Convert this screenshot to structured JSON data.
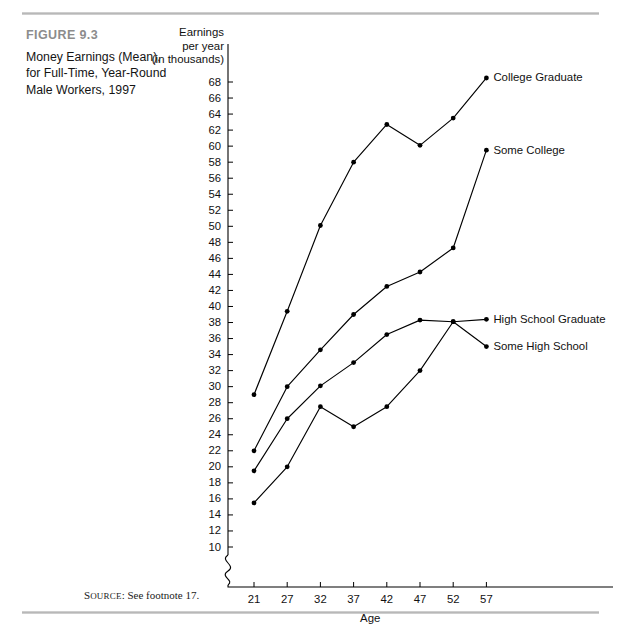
{
  "figure": {
    "label": "FIGURE 9.3",
    "title": "Money Earnings (Mean), for Full-Time, Year-Round Male Workers, 1997",
    "source_prefix": "S",
    "source_smallcaps": "OURCE",
    "source_text": ": See footnote 17."
  },
  "chart_data": {
    "type": "line",
    "title": "Money Earnings (Mean), for Full-Time, Year-Round Male Workers, 1997",
    "xlabel": "Age",
    "ylabel": "Earnings per year (in thousands)",
    "ylabel_lines": [
      "Earnings",
      "per year",
      "(in thousands)"
    ],
    "x": [
      21,
      27,
      32,
      37,
      42,
      47,
      52,
      57
    ],
    "xticklabels": [
      "21",
      "27",
      "32",
      "37",
      "42",
      "47",
      "52",
      "57"
    ],
    "yticks": [
      10,
      12,
      14,
      16,
      18,
      20,
      22,
      24,
      26,
      28,
      30,
      32,
      34,
      36,
      38,
      40,
      42,
      44,
      46,
      48,
      50,
      52,
      54,
      56,
      58,
      60,
      62,
      64,
      66,
      68
    ],
    "ylim": [
      9,
      69
    ],
    "xlim": [
      18.5,
      60
    ],
    "axis_break": true,
    "grid": false,
    "legend_position": "right-inline-labels",
    "marker": "filled-circle",
    "line_color": "#000000",
    "series": [
      {
        "name": "College Graduate",
        "values": [
          29.0,
          39.4,
          50.1,
          58.0,
          62.7,
          60.1,
          63.5,
          68.5
        ],
        "label_x": 57,
        "label_y": 68.5
      },
      {
        "name": "Some College",
        "values": [
          22.0,
          30.0,
          34.6,
          39.0,
          42.5,
          44.3,
          47.3,
          59.5
        ],
        "label_x": 57,
        "label_y": 59.5
      },
      {
        "name": "High School Graduate",
        "values": [
          19.5,
          26.0,
          30.1,
          33.0,
          36.5,
          38.3,
          38.1,
          38.4
        ],
        "label_x": 57,
        "label_y": 38.4
      },
      {
        "name": "Some High School",
        "values": [
          15.5,
          20.0,
          27.5,
          25.0,
          27.5,
          32.0,
          38.1,
          35.0
        ],
        "label_x": 57,
        "label_y": 35.0
      }
    ]
  }
}
